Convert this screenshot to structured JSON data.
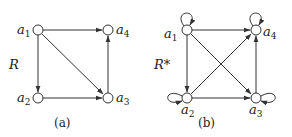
{
  "diagrams": [
    {
      "id": "a",
      "relation_label": "R",
      "caption": "(a)",
      "nodes": [
        {
          "id": "a1",
          "label": "a",
          "sub": "1"
        },
        {
          "id": "a2",
          "label": "a",
          "sub": "2"
        },
        {
          "id": "a3",
          "label": "a",
          "sub": "3"
        },
        {
          "id": "a4",
          "label": "a",
          "sub": "4"
        }
      ],
      "edges": [
        [
          "a1",
          "a4"
        ],
        [
          "a1",
          "a2"
        ],
        [
          "a1",
          "a3"
        ],
        [
          "a2",
          "a3"
        ],
        [
          "a3",
          "a4"
        ]
      ]
    },
    {
      "id": "b",
      "relation_label": "R*",
      "caption": "(b)",
      "nodes": [
        {
          "id": "a1",
          "label": "a",
          "sub": "1"
        },
        {
          "id": "a2",
          "label": "a",
          "sub": "2"
        },
        {
          "id": "a3",
          "label": "a",
          "sub": "3"
        },
        {
          "id": "a4",
          "label": "a",
          "sub": "4"
        }
      ],
      "edges": [
        [
          "a1",
          "a4"
        ],
        [
          "a1",
          "a2"
        ],
        [
          "a1",
          "a3"
        ],
        [
          "a2",
          "a3"
        ],
        [
          "a2",
          "a4"
        ],
        [
          "a3",
          "a4"
        ],
        [
          "a1",
          "a1"
        ],
        [
          "a2",
          "a2"
        ],
        [
          "a3",
          "a3"
        ],
        [
          "a4",
          "a4"
        ]
      ]
    }
  ],
  "colors": {
    "stroke": "#333333",
    "node_fill": "#ffffff"
  }
}
